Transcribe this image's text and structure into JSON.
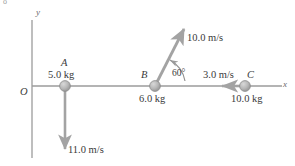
{
  "figure": {
    "corner_mark": "o",
    "axes": {
      "x_label": "x",
      "y_label": "y",
      "origin_label": "O"
    },
    "objects": [
      {
        "id": "A",
        "name_label": "A",
        "mass_label": "5.0 kg",
        "velocity_label": "11.0 m/s",
        "velocity_direction": "down"
      },
      {
        "id": "B",
        "name_label": "B",
        "mass_label": "6.0 kg",
        "velocity_label": "10.0 m/s",
        "velocity_direction": "up-right",
        "angle_label": "60°"
      },
      {
        "id": "C",
        "name_label": "C",
        "mass_label": "10.0 kg",
        "velocity_label": "3.0 m/s",
        "velocity_direction": "left"
      }
    ],
    "colors": {
      "axis": "#9b9b9b",
      "vector": "#a3a3a3",
      "ball_fill": "#b6b6b6",
      "ball_edge": "#8d8d8d",
      "text": "#3a3a3a"
    }
  }
}
